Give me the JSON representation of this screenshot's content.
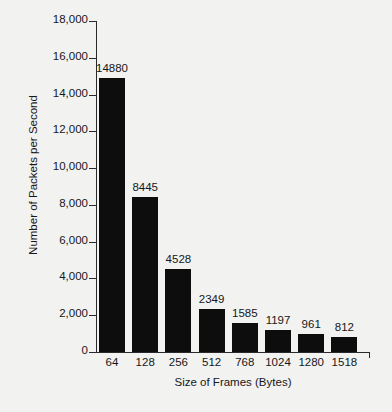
{
  "chart_data": {
    "type": "bar",
    "title": "",
    "subtitle": "",
    "xlabel": "Size of Frames (Bytes)",
    "ylabel": "Number of Packets per Second",
    "categories": [
      "64",
      "128",
      "256",
      "512",
      "768",
      "1024",
      "1280",
      "1518"
    ],
    "values": [
      14880,
      8445,
      4528,
      2349,
      1585,
      1197,
      961,
      812
    ],
    "value_labels": [
      "14880",
      "8445",
      "4528",
      "2349",
      "1585",
      "1197",
      "961",
      "812"
    ],
    "ylim": [
      0,
      18000
    ],
    "ytick_values": [
      0,
      2000,
      4000,
      6000,
      8000,
      10000,
      12000,
      14000,
      16000,
      18000
    ],
    "ytick_labels": [
      "0",
      "2,000",
      "4,000",
      "6,000",
      "8,000",
      "10,000",
      "12,000",
      "14,000",
      "16,000",
      "18,000"
    ],
    "grid": false,
    "legend": false,
    "bar_color": "#0d0d0e",
    "axis_color": "#2a2a2c",
    "text_color": "#17171a",
    "background_color": "#f2f2f0"
  }
}
